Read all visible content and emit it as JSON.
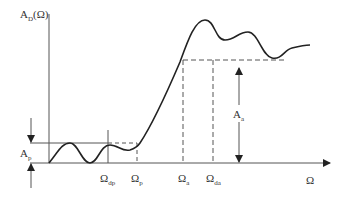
{
  "diagram": {
    "type": "filter-magnitude-response",
    "y_axis_label": {
      "main": "A",
      "sub": "D",
      "suffix": "(Ω)"
    },
    "x_axis_label": "Ω",
    "annotations": {
      "passband_ripple": {
        "main": "A",
        "sub": "p"
      },
      "stopband_attenuation": {
        "main": "A",
        "sub": "a"
      }
    },
    "frequency_marks": [
      {
        "main": "Ω",
        "sub": "dp"
      },
      {
        "main": "Ω",
        "sub": "p"
      },
      {
        "main": "Ω",
        "sub": "a"
      },
      {
        "main": "Ω",
        "sub": "da"
      }
    ],
    "colors": {
      "curve": "#222222",
      "axes": "#555555",
      "dashed": "#555555",
      "text": "#333333"
    }
  }
}
